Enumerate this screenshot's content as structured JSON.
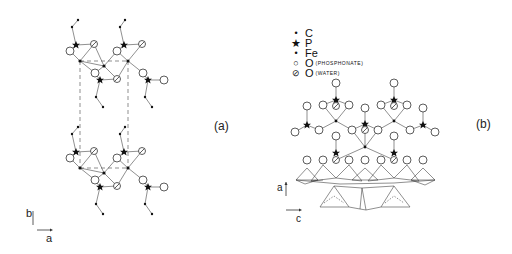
{
  "panels": {
    "a": {
      "label": "(a)",
      "axes": {
        "vertical": "b",
        "horizontal": "a"
      }
    },
    "b": {
      "label": "(b)",
      "axes": {
        "vertical": "a",
        "horizontal": "c"
      }
    }
  },
  "legend": {
    "items": [
      {
        "symbol": "small-dot",
        "element": "C",
        "note": ""
      },
      {
        "symbol": "star",
        "element": "P",
        "note": ""
      },
      {
        "symbol": "dot",
        "element": "Fe",
        "note": ""
      },
      {
        "symbol": "open-circle",
        "element": "O",
        "note": "(PHOSPHONATE)"
      },
      {
        "symbol": "hatched-circle",
        "element": "O",
        "note": "(WATER)"
      }
    ]
  },
  "colors": {
    "ink": "#222222",
    "background": "#ffffff"
  }
}
